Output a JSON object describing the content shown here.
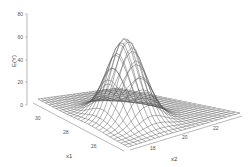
{
  "chart_data": {
    "type": "surface",
    "title": "",
    "zlabel": "E(Y)",
    "xlabel": "x1",
    "ylabel": "x2",
    "x1_ticks": [
      30,
      28,
      26
    ],
    "x2_ticks": [
      18,
      20,
      22
    ],
    "z_ticks": [
      0,
      20,
      40,
      60,
      80
    ],
    "zlim": [
      0,
      80
    ],
    "x1_range": [
      24,
      31
    ],
    "x2_range": [
      17,
      23
    ],
    "surface": {
      "description": "Gaussian bump wireframe mesh",
      "peak_value": 70,
      "peak_x1": 26.5,
      "peak_x2": 19.5,
      "sigma_x1": 0.9,
      "sigma_x2": 0.8,
      "grid_n": 25
    },
    "line_color": "#555555",
    "grid": false,
    "legend": null
  },
  "projection": {
    "origin_back": [
      118,
      88
    ],
    "corner_left": [
      38,
      99
    ],
    "corner_right": [
      240,
      113
    ],
    "corner_front": [
      128,
      147
    ],
    "z_axis_x": 27,
    "z_px_per_unit": 1.14
  }
}
